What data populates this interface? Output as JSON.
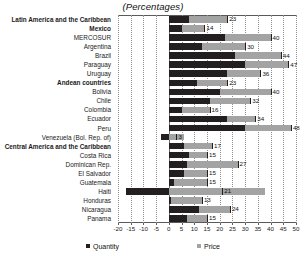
{
  "subtitle": "(Percentages)",
  "legend": {
    "items": [
      {
        "label": "Quantity",
        "color": "#231f20",
        "key": "quantity"
      },
      {
        "label": "Price",
        "color": "#a3a3a3",
        "key": "price"
      }
    ]
  },
  "axis": {
    "ticks": [
      "-20",
      "-15",
      "-10",
      "-5",
      "0",
      "5",
      "10",
      "15",
      "20",
      "25",
      "30",
      "35",
      "40",
      "45",
      "50"
    ],
    "min": -20,
    "max": 50,
    "step": 5
  },
  "chart_data": {
    "type": "bar",
    "orientation": "horizontal",
    "stacked": true,
    "title": "",
    "subtitle": "(Percentages)",
    "xlabel": "",
    "ylabel": "",
    "xlim": [
      -20,
      50
    ],
    "grid": true,
    "legend_position": "bottom",
    "categories": [
      "Latin America and the Caribbean",
      "Mexico",
      "MERCOSUR",
      "Argentina",
      "Brazil",
      "Paraguay",
      "Uruguay",
      "Andean countries",
      "Bolivia",
      "Chile",
      "Colombia",
      "Ecuador",
      "Peru",
      "Venezuela (Bol. Rep. of)",
      "Central America and the Caribbean",
      "Costa Rica",
      "Dominican Rep.",
      "El Salvador",
      "Guatemala",
      "Haiti",
      "Honduras",
      "Nicaragua",
      "Panama"
    ],
    "bold_categories": [
      "Latin America and the Caribbean",
      "Mexico",
      "Andean countries",
      "Central America and the Caribbean"
    ],
    "series": [
      {
        "name": "Quantity",
        "color": "#231f20",
        "values": [
          8,
          5,
          22,
          13,
          26,
          30,
          23,
          11,
          20,
          16,
          5,
          23,
          30,
          -3,
          6,
          8,
          7,
          6,
          2,
          -17,
          1,
          12,
          7
        ]
      },
      {
        "name": "Price",
        "color": "#a3a3a3",
        "values": [
          15,
          9,
          18,
          17,
          18,
          17,
          13,
          12,
          20,
          16,
          11,
          11,
          18,
          6,
          11,
          7,
          20,
          9,
          13,
          38,
          12,
          12,
          8
        ]
      }
    ],
    "totals": [
      23,
      14,
      40,
      30,
      44,
      47,
      36,
      23,
      40,
      32,
      16,
      34,
      48,
      3,
      17,
      15,
      27,
      15,
      15,
      21,
      13,
      24,
      15
    ],
    "total_labels": [
      "23",
      "14",
      "40",
      "30",
      "44",
      "47",
      "36",
      "23",
      "40",
      "32",
      "16",
      "34",
      "48",
      "3",
      "17",
      "15",
      "27",
      "15",
      "15",
      "21",
      "13",
      "24",
      "15"
    ]
  }
}
